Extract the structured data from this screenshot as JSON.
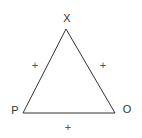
{
  "diagram": {
    "type": "triangle",
    "vertices": [
      {
        "id": "X",
        "label": "X"
      },
      {
        "id": "P",
        "label": "P"
      },
      {
        "id": "O",
        "label": "O"
      }
    ],
    "edges": [
      {
        "from": "X",
        "to": "P",
        "mark": "+"
      },
      {
        "from": "X",
        "to": "O",
        "mark": "+"
      },
      {
        "from": "P",
        "to": "O",
        "mark": "+"
      }
    ],
    "colors": {
      "stroke": "#333333",
      "text": "#333333",
      "mark": "#555555",
      "background": "#ffffff"
    }
  }
}
